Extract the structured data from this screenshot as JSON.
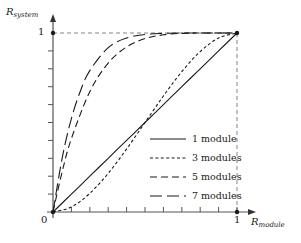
{
  "chart_data": {
    "type": "line",
    "title": "",
    "xlabel": "R_module",
    "ylabel": "R_system",
    "xlabel_base": "R",
    "xlabel_sub": "module",
    "ylabel_base": "R",
    "ylabel_sub": "system",
    "xlim": [
      0,
      1
    ],
    "ylim": [
      0,
      1
    ],
    "xticks": [
      0,
      0.1,
      0.2,
      0.3,
      0.4,
      0.5,
      0.6,
      0.7,
      0.8,
      0.9,
      1
    ],
    "yticks": [
      0,
      0.1,
      0.2,
      0.3,
      0.4,
      0.5,
      0.6,
      0.7,
      0.8,
      0.9,
      1
    ],
    "xtick_labels": [
      "0",
      "1"
    ],
    "ytick_labels": [
      "1"
    ],
    "grid": false,
    "guide_lines": "dashed box at x=1 and y=1",
    "legend_position": "center-right-inside",
    "series": [
      {
        "name": "1 module",
        "style": "solid",
        "color": "#1a1a1a",
        "x": [
          0,
          0.1,
          0.2,
          0.3,
          0.4,
          0.5,
          0.6,
          0.7,
          0.8,
          0.9,
          1
        ],
        "values": [
          0,
          0.1,
          0.2,
          0.3,
          0.4,
          0.5,
          0.6,
          0.7,
          0.8,
          0.9,
          1
        ]
      },
      {
        "name": "3 modules",
        "style": "dotted-short-dash",
        "color": "#1a1a1a",
        "x": [
          0,
          0.1,
          0.2,
          0.3,
          0.4,
          0.5,
          0.6,
          0.7,
          0.8,
          0.9,
          1
        ],
        "values": [
          0,
          0.028,
          0.104,
          0.216,
          0.352,
          0.5,
          0.648,
          0.784,
          0.896,
          0.972,
          1
        ]
      },
      {
        "name": "5 modules",
        "style": "medium-dash",
        "color": "#1a1a1a",
        "x": [
          0,
          0.05,
          0.1,
          0.2,
          0.3,
          0.4,
          0.5,
          0.6,
          0.7,
          0.8,
          0.9,
          1
        ],
        "values": [
          0,
          0.226,
          0.41,
          0.672,
          0.832,
          0.922,
          0.969,
          0.99,
          0.998,
          1,
          1,
          1
        ]
      },
      {
        "name": "7 modules",
        "style": "long-dash",
        "color": "#1a1a1a",
        "x": [
          0,
          0.05,
          0.1,
          0.15,
          0.2,
          0.3,
          0.4,
          0.5,
          0.6,
          0.7,
          0.8,
          0.9,
          1
        ],
        "values": [
          0,
          0.302,
          0.522,
          0.679,
          0.79,
          0.918,
          0.972,
          0.992,
          0.998,
          1,
          1,
          1,
          1
        ]
      }
    ]
  },
  "axes": {
    "y_axis_label": "R",
    "y_axis_sub": "system",
    "x_axis_label": "R",
    "x_axis_sub": "module",
    "y_tick_one": "1",
    "x_tick_zero": "0",
    "x_tick_one": "1"
  },
  "legend": {
    "items": [
      {
        "label": "1 module",
        "style": "solid"
      },
      {
        "label": "3 modules",
        "style": "dashed-short"
      },
      {
        "label": "5 modules",
        "style": "dashed-medium"
      },
      {
        "label": "7 modules",
        "style": "dashed-long"
      }
    ]
  },
  "colors": {
    "ink": "#1a1a1a",
    "axis": "#555555",
    "guide": "#777777",
    "background": "#ffffff"
  }
}
